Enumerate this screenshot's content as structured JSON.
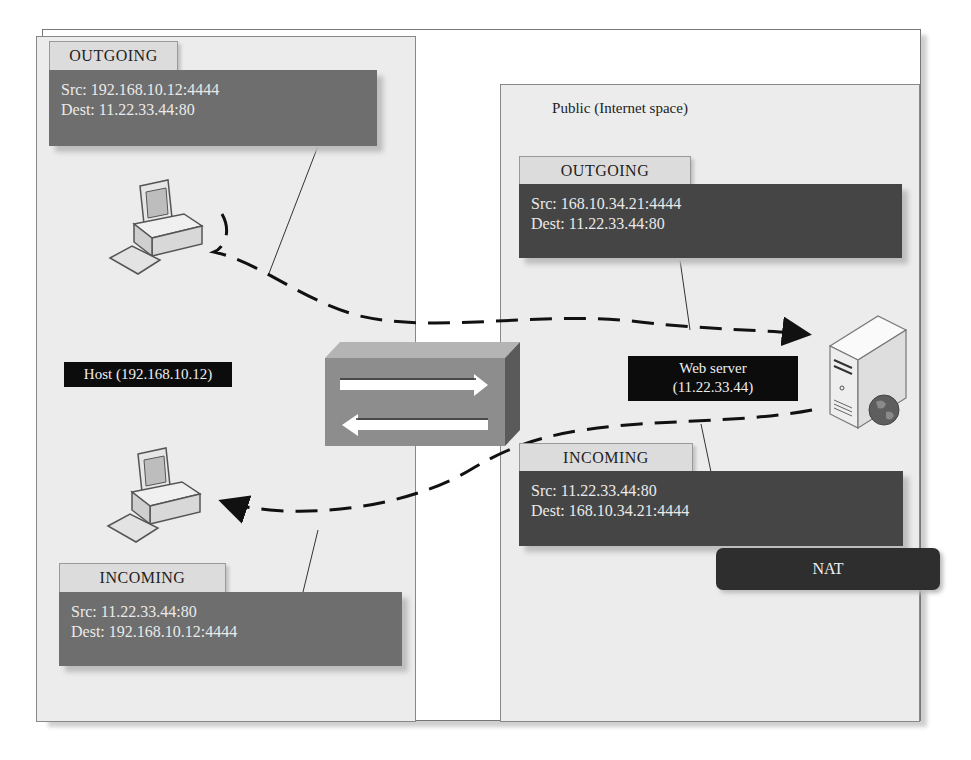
{
  "diagram": {
    "private_zone": {
      "host_label": "Host (192.168.10.12)",
      "outgoing": {
        "tab": "OUTGOING",
        "src": "Src: 192.168.10.12:4444",
        "dest": "Dest: 11.22.33.44:80"
      },
      "incoming": {
        "tab": "INCOMING",
        "src": "Src: 11.22.33.44:80",
        "dest": "Dest: 192.168.10.12:4444"
      },
      "icons": [
        "desktop-computer-icon",
        "desktop-computer-icon"
      ]
    },
    "nat_device": {
      "icon": "router-box-icon",
      "arrows": [
        "arrow-right",
        "arrow-left"
      ]
    },
    "public_zone": {
      "title": "Public (Internet space)",
      "server_label_line1": "Web server",
      "server_label_line2": "(11.22.33.44)",
      "outgoing": {
        "tab": "OUTGOING",
        "src": "Src: 168.10.34.21:4444",
        "dest": "Dest: 11.22.33.44:80"
      },
      "incoming": {
        "tab": "INCOMING",
        "src": "Src: 11.22.33.44:80",
        "dest": "Dest: 168.10.34.21:4444"
      },
      "nat_label": "NAT",
      "icons": [
        "web-server-icon",
        "globe-icon"
      ]
    },
    "colors": {
      "zone_bg": "#ececec",
      "packet_light": "#6e6e6e",
      "packet_dark": "#454545",
      "label_black": "#0c0c0c",
      "nat_bg": "#2e2e2e"
    }
  }
}
